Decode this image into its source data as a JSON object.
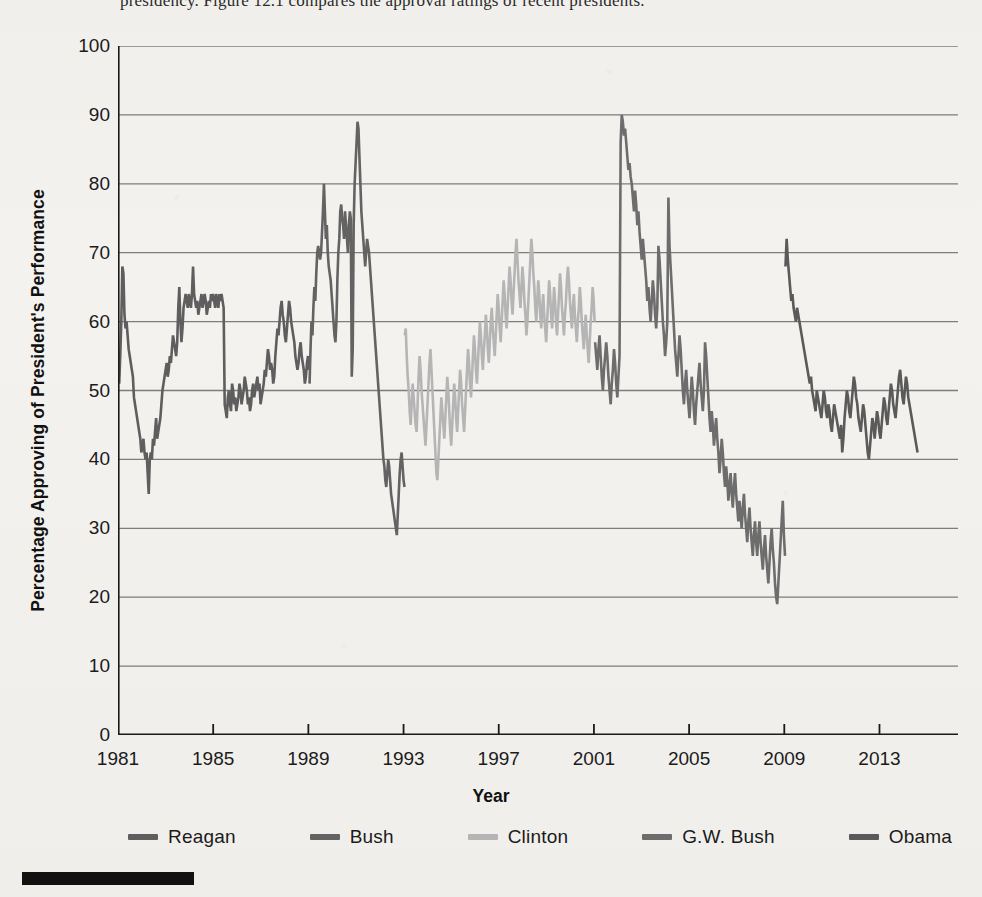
{
  "page": {
    "background_color": "#f4f2ef",
    "cropped_caption_top": "presidency. Figure 12.1 compares the approval ratings of recent presidents."
  },
  "chart_data": {
    "type": "line",
    "title": "",
    "xlabel": "Year",
    "ylabel": "Percentage Approving of President's Performance",
    "xlim": [
      1981,
      2016.3
    ],
    "ylim": [
      0,
      100
    ],
    "grid": true,
    "grid_axis": "y",
    "grid_color": "#7d7d7d",
    "axis_color": "#1a1a1a",
    "legend_position": "below-axis",
    "x_ticks": [
      1981,
      1985,
      1989,
      1993,
      1997,
      2001,
      2005,
      2009,
      2013
    ],
    "x_tick_labels": [
      "1981",
      "1985",
      "1989",
      "1993",
      "1997",
      "2001",
      "2005",
      "2009",
      "2013"
    ],
    "y_ticks": [
      0,
      10,
      20,
      30,
      40,
      50,
      60,
      70,
      80,
      90,
      100
    ],
    "y_tick_labels": [
      "0",
      "10",
      "20",
      "30",
      "40",
      "50",
      "60",
      "70",
      "80",
      "90",
      "100"
    ],
    "series": [
      {
        "name": "Reagan",
        "color": "#5e5e5e",
        "x_start": 1981.05,
        "x_end": 1989.03,
        "values": [
          51,
          55,
          60,
          68,
          67,
          61,
          59,
          60,
          58,
          56,
          55,
          54,
          53,
          52,
          49,
          48,
          47,
          46,
          45,
          44,
          43,
          41,
          42,
          43,
          41,
          40,
          41,
          38,
          35,
          40,
          41,
          40,
          43,
          42,
          44,
          46,
          43,
          44,
          45,
          46,
          48,
          50,
          51,
          52,
          53,
          54,
          52,
          53,
          55,
          54,
          56,
          58,
          57,
          56,
          55,
          57,
          62,
          65,
          60,
          57,
          59,
          62,
          63,
          64,
          63,
          62,
          64,
          63,
          62,
          64,
          68,
          64,
          63,
          62,
          63,
          61,
          62,
          63,
          64,
          62,
          63,
          64,
          63,
          61,
          62,
          63,
          62,
          64,
          63,
          64,
          63,
          62,
          64,
          63,
          62,
          64,
          63,
          64,
          63,
          62,
          48,
          47,
          46,
          49,
          50,
          48,
          47,
          51,
          50,
          48,
          49,
          47,
          48,
          49,
          51,
          50,
          48,
          49,
          50,
          52,
          51,
          50,
          48,
          49,
          47,
          48,
          50,
          51,
          49,
          50,
          51,
          52,
          50,
          51,
          48,
          49,
          50,
          51,
          53,
          52,
          54,
          56,
          55,
          53,
          54,
          53,
          51,
          52,
          55,
          57,
          59,
          58,
          60,
          62,
          63,
          61,
          60,
          58,
          57,
          59,
          61,
          63,
          62,
          60,
          59,
          58,
          57,
          55,
          54,
          53,
          54,
          56,
          57,
          55,
          54,
          53,
          51,
          52,
          54,
          55,
          53
        ]
      },
      {
        "name": "Bush",
        "color": "#636363",
        "x_start": 1989.05,
        "x_end": 1993.04,
        "values": [
          51,
          56,
          60,
          58,
          62,
          65,
          63,
          67,
          70,
          71,
          70,
          69,
          70,
          73,
          76,
          80,
          76,
          72,
          74,
          70,
          68,
          67,
          66,
          64,
          62,
          60,
          58,
          57,
          60,
          66,
          70,
          72,
          76,
          77,
          75,
          74,
          72,
          76,
          74,
          72,
          70,
          74,
          76,
          75,
          52,
          56,
          74,
          80,
          83,
          86,
          89,
          88,
          84,
          80,
          76,
          74,
          72,
          70,
          68,
          70,
          72,
          71,
          70,
          68,
          66,
          64,
          62,
          60,
          58,
          56,
          54,
          52,
          50,
          48,
          46,
          44,
          42,
          40,
          39,
          37,
          36,
          38,
          40,
          39,
          37,
          35,
          34,
          33,
          32,
          31,
          30,
          29,
          32,
          35,
          38,
          40,
          41,
          39,
          37,
          36
        ]
      },
      {
        "name": "Clinton",
        "color": "#b5b5b5",
        "x_start": 1993.05,
        "x_end": 2001.03,
        "values": [
          58,
          59,
          55,
          52,
          50,
          47,
          45,
          48,
          51,
          49,
          47,
          45,
          44,
          48,
          52,
          55,
          53,
          50,
          48,
          46,
          44,
          42,
          45,
          48,
          51,
          54,
          56,
          53,
          50,
          47,
          44,
          41,
          38,
          37,
          40,
          43,
          46,
          49,
          47,
          45,
          43,
          46,
          49,
          52,
          50,
          47,
          44,
          42,
          45,
          48,
          51,
          49,
          46,
          44,
          47,
          50,
          53,
          51,
          48,
          46,
          44,
          47,
          50,
          53,
          56,
          54,
          51,
          49,
          52,
          55,
          58,
          56,
          53,
          51,
          54,
          57,
          60,
          58,
          55,
          53,
          56,
          58,
          61,
          59,
          56,
          54,
          57,
          60,
          62,
          59,
          57,
          55,
          58,
          61,
          64,
          62,
          59,
          57,
          60,
          63,
          66,
          64,
          61,
          59,
          62,
          65,
          68,
          66,
          63,
          61,
          64,
          67,
          70,
          72,
          69,
          66,
          64,
          62,
          65,
          68,
          66,
          63,
          61,
          58,
          60,
          63,
          66,
          69,
          72,
          70,
          67,
          65,
          62,
          60,
          63,
          66,
          64,
          61,
          59,
          62,
          64,
          61,
          59,
          57,
          60,
          63,
          66,
          64,
          61,
          59,
          62,
          65,
          63,
          60,
          58,
          61,
          64,
          67,
          65,
          62,
          60,
          58,
          61,
          63,
          66,
          68,
          66,
          63,
          61,
          59,
          62,
          64,
          61,
          59,
          57,
          60,
          62,
          65,
          63,
          60,
          58,
          56,
          59,
          61,
          58,
          56,
          54,
          57,
          60,
          62,
          65,
          63,
          60
        ]
      },
      {
        "name": "G.W. Bush",
        "color": "#6d6d6d",
        "x_start": 2001.05,
        "x_end": 2009.03,
        "values": [
          57,
          55,
          53,
          56,
          58,
          55,
          52,
          50,
          53,
          55,
          57,
          55,
          52,
          50,
          48,
          51,
          53,
          56,
          54,
          51,
          49,
          52,
          55,
          86,
          90,
          89,
          87,
          88,
          86,
          84,
          82,
          83,
          81,
          80,
          78,
          76,
          79,
          77,
          74,
          76,
          73,
          71,
          69,
          72,
          70,
          68,
          66,
          63,
          65,
          62,
          60,
          63,
          66,
          64,
          61,
          59,
          62,
          71,
          69,
          66,
          63,
          60,
          58,
          55,
          57,
          60,
          78,
          71,
          68,
          65,
          62,
          59,
          56,
          54,
          52,
          55,
          58,
          56,
          53,
          50,
          48,
          51,
          53,
          50,
          48,
          46,
          49,
          52,
          50,
          47,
          45,
          48,
          50,
          52,
          54,
          51,
          49,
          47,
          50,
          57,
          55,
          52,
          49,
          46,
          44,
          47,
          45,
          42,
          44,
          46,
          43,
          41,
          38,
          40,
          43,
          41,
          38,
          36,
          39,
          37,
          34,
          36,
          38,
          35,
          33,
          36,
          38,
          35,
          33,
          31,
          34,
          32,
          30,
          33,
          35,
          32,
          30,
          28,
          31,
          33,
          30,
          28,
          26,
          29,
          31,
          28,
          26,
          29,
          31,
          28,
          26,
          24,
          27,
          29,
          26,
          24,
          22,
          25,
          28,
          30,
          27,
          25,
          22,
          20,
          19,
          22,
          25,
          28,
          31,
          34,
          29,
          26
        ]
      },
      {
        "name": "Obama",
        "color": "#5a5a5a",
        "x_start": 2009.05,
        "x_end": 2014.6,
        "values": [
          68,
          72,
          69,
          67,
          65,
          63,
          64,
          62,
          61,
          60,
          62,
          61,
          60,
          59,
          58,
          57,
          56,
          55,
          54,
          53,
          52,
          51,
          52,
          50,
          49,
          48,
          47,
          50,
          49,
          48,
          47,
          46,
          48,
          50,
          49,
          47,
          46,
          48,
          47,
          45,
          44,
          46,
          48,
          47,
          46,
          45,
          44,
          43,
          45,
          41,
          43,
          46,
          48,
          50,
          49,
          47,
          46,
          48,
          50,
          52,
          51,
          49,
          48,
          46,
          45,
          44,
          46,
          48,
          47,
          45,
          43,
          41,
          40,
          42,
          44,
          46,
          45,
          43,
          45,
          47,
          46,
          44,
          43,
          45,
          47,
          49,
          48,
          46,
          45,
          47,
          49,
          51,
          50,
          48,
          47,
          46,
          48,
          50,
          52,
          53,
          51,
          49,
          48,
          50,
          52,
          51,
          49,
          48,
          47,
          46,
          45,
          44,
          43,
          42,
          41
        ]
      }
    ]
  },
  "legend": {
    "items": [
      {
        "label": "Reagan",
        "color": "#5e5e5e"
      },
      {
        "label": "Bush",
        "color": "#636363"
      },
      {
        "label": "Clinton",
        "color": "#b5b5b5"
      },
      {
        "label": "G.W. Bush",
        "color": "#6d6d6d"
      },
      {
        "label": "Obama",
        "color": "#5a5a5a"
      }
    ]
  }
}
